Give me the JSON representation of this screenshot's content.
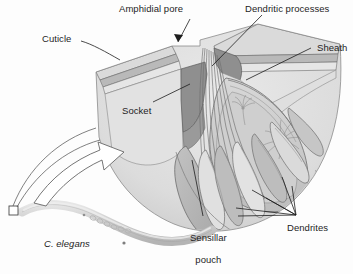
{
  "figure": {
    "kind": "scientific-illustration",
    "palette": {
      "background": "#fdfdfd",
      "outline": "#4a4a4a",
      "text": "#1d1d1d",
      "cuticle_light": "#e4e4e4",
      "cuticle_mid": "#cfcfcf",
      "hypodermis": "#dcdcdc",
      "socket_dark": "#8e8e8e",
      "sheath_mid": "#c3c3c3",
      "pouch_gray": "#b6b6b6",
      "dendrite_gray": "#a9a9a9",
      "worm_gray": "#cbcbcb"
    }
  },
  "labels": {
    "cuticle": "Cuticle",
    "amphidial_pore": "Amphidial pore",
    "dendritic_processes": "Dendritic processes",
    "sheath": "Sheath",
    "socket": "Socket",
    "sensillar_pouch_line1": "Sensillar",
    "sensillar_pouch_line2": "pouch",
    "dendrites": "Dendrites",
    "organism": "C. elegans"
  },
  "callouts": [
    {
      "name": "cuticle",
      "text": "Cuticle",
      "has_leader": true,
      "leader_style": "plain"
    },
    {
      "name": "amphidial-pore",
      "text": "Amphidial pore",
      "has_leader": true,
      "leader_style": "arrowhead"
    },
    {
      "name": "dendritic-processes",
      "text": "Dendritic processes",
      "has_leader": true,
      "leader_style": "plain"
    },
    {
      "name": "sheath",
      "text": "Sheath",
      "has_leader": true,
      "leader_style": "plain"
    },
    {
      "name": "socket",
      "text": "Socket",
      "has_leader": true,
      "leader_style": "plain"
    },
    {
      "name": "sensillar-pouch",
      "text": "Sensillar pouch",
      "has_leader": true,
      "leader_style": "plain"
    },
    {
      "name": "dendrites",
      "text": "Dendrites",
      "has_leader": true,
      "leader_style": "multi-branch"
    }
  ],
  "inset": {
    "organism_label": "C. elegans",
    "zoom_box": "magnification source box at worm head",
    "arrow": "curved hollow magnification arrow pointing up-right"
  }
}
